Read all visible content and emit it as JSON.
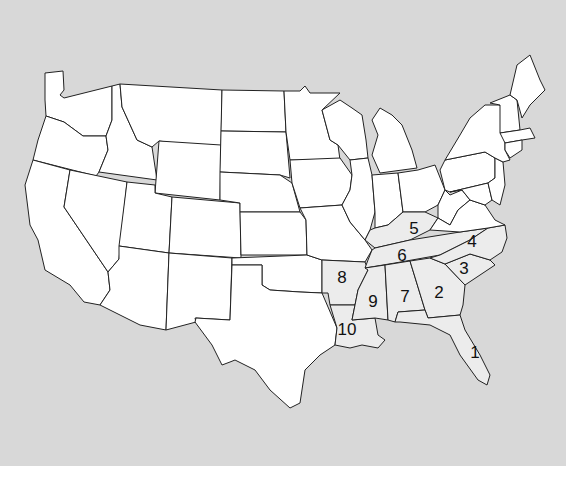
{
  "map": {
    "title": "",
    "background": "#d8d8d8",
    "state_fill": "#ffffff",
    "highlight_fill": "#ececec",
    "labels": [
      {
        "number": "1",
        "state": "Florida",
        "x": 475,
        "y": 358
      },
      {
        "number": "2",
        "state": "Georgia",
        "x": 439,
        "y": 298
      },
      {
        "number": "3",
        "state": "South Carolina",
        "x": 464,
        "y": 274
      },
      {
        "number": "4",
        "state": "North Carolina",
        "x": 472,
        "y": 247
      },
      {
        "number": "5",
        "state": "Kentucky",
        "x": 414,
        "y": 234
      },
      {
        "number": "6",
        "state": "Tennessee",
        "x": 402,
        "y": 261
      },
      {
        "number": "7",
        "state": "Alabama",
        "x": 405,
        "y": 302
      },
      {
        "number": "8",
        "state": "Arkansas",
        "x": 342,
        "y": 283
      },
      {
        "number": "9",
        "state": "Mississippi",
        "x": 373,
        "y": 307
      },
      {
        "number": "10",
        "state": "Louisiana",
        "x": 347,
        "y": 335
      }
    ]
  }
}
